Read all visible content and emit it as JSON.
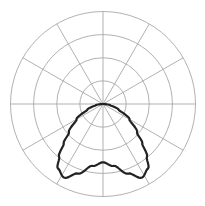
{
  "chart_data": {
    "type": "polar",
    "title": "",
    "subtitle": "",
    "legend": [],
    "grid": true,
    "rings": 4,
    "spoke_interval_deg": 30,
    "angle_zero": "down",
    "symmetric": true,
    "r_max": 1.0,
    "series": [
      {
        "name": "intensity",
        "angles_deg": [
          0,
          10,
          20,
          28,
          35,
          40,
          45,
          50,
          60,
          70,
          80,
          90
        ],
        "values": [
          0.63,
          0.68,
          0.8,
          0.9,
          0.85,
          0.74,
          0.6,
          0.48,
          0.33,
          0.18,
          0.08,
          0.0
        ]
      }
    ]
  },
  "style": {
    "background": "#ffffff",
    "grid_color": "#a8a8a8",
    "curve_color": "#222222"
  }
}
